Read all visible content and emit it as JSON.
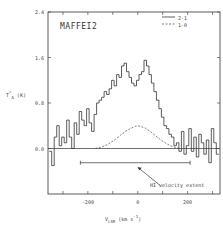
{
  "chart_data": {
    "type": "line",
    "title": "MAFFEI2",
    "xlabel": "V_LSR (km s^-1)",
    "ylabel": "T*_A (K)",
    "xlim": [
      -360,
      330
    ],
    "ylim": [
      -0.8,
      2.4
    ],
    "x_ticks": [
      -300,
      -200,
      -100,
      0,
      100,
      200,
      300
    ],
    "x_tick_labels": [
      "-200",
      "0",
      "200"
    ],
    "x_tick_label_values": [
      -200,
      0,
      200
    ],
    "y_tick_labels": [
      "2.4",
      "1.6",
      "0.8",
      "0.0"
    ],
    "y_tick_values": [
      2.4,
      1.6,
      0.8,
      0.0
    ],
    "grid": false,
    "legend_position": "upper right",
    "legend": [
      {
        "label": "2-1",
        "style": "solid"
      },
      {
        "label": "1-0",
        "style": "dashed"
      }
    ],
    "series": [
      {
        "name": "2-1",
        "style": "solid-histogram",
        "x": [
          -350,
          -340,
          -330,
          -320,
          -310,
          -300,
          -290,
          -280,
          -270,
          -260,
          -250,
          -240,
          -230,
          -220,
          -210,
          -200,
          -190,
          -180,
          -170,
          -160,
          -150,
          -140,
          -130,
          -120,
          -110,
          -100,
          -90,
          -80,
          -70,
          -60,
          -50,
          -40,
          -30,
          -20,
          -10,
          0,
          10,
          20,
          30,
          40,
          50,
          60,
          70,
          80,
          90,
          100,
          110,
          120,
          130,
          140,
          150,
          160,
          170,
          180,
          190,
          200,
          210,
          220,
          230,
          240,
          250,
          260,
          270,
          280,
          290,
          300,
          310,
          320
        ],
        "values": [
          -0.05,
          -0.3,
          0.2,
          0.4,
          0.05,
          0.2,
          0.1,
          0.5,
          0.2,
          0.0,
          0.45,
          0.25,
          0.65,
          0.5,
          0.4,
          0.7,
          0.45,
          0.3,
          0.6,
          0.8,
          0.85,
          0.9,
          1.0,
          0.95,
          1.05,
          1.2,
          1.1,
          1.3,
          1.25,
          1.45,
          1.5,
          1.35,
          1.25,
          1.15,
          1.1,
          1.2,
          1.3,
          1.35,
          1.55,
          1.45,
          1.3,
          1.15,
          1.0,
          0.85,
          0.7,
          0.55,
          0.4,
          0.35,
          0.25,
          0.2,
          0.05,
          0.1,
          -0.05,
          0.3,
          -0.1,
          0.05,
          0.35,
          -0.05,
          0.2,
          -0.15,
          0.25,
          0.1,
          -0.1,
          0.15,
          -0.25,
          0.35,
          0.1,
          -0.1
        ]
      },
      {
        "name": "1-0",
        "style": "dashed",
        "x": [
          -170,
          -150,
          -130,
          -110,
          -90,
          -70,
          -50,
          -30,
          -10,
          0,
          10,
          30,
          50,
          70,
          90,
          110,
          130,
          150,
          170
        ],
        "values": [
          0.0,
          0.02,
          0.05,
          0.1,
          0.16,
          0.23,
          0.3,
          0.35,
          0.39,
          0.4,
          0.39,
          0.36,
          0.3,
          0.23,
          0.16,
          0.1,
          0.05,
          0.02,
          0.0
        ]
      }
    ],
    "annotations": [
      {
        "text": "HI velocity extent",
        "type": "range-bar",
        "x_range": [
          -230,
          210
        ],
        "y": -0.25,
        "arrow_from": [
          90,
          -0.65
        ],
        "arrow_to": [
          0,
          -0.33
        ]
      }
    ]
  }
}
